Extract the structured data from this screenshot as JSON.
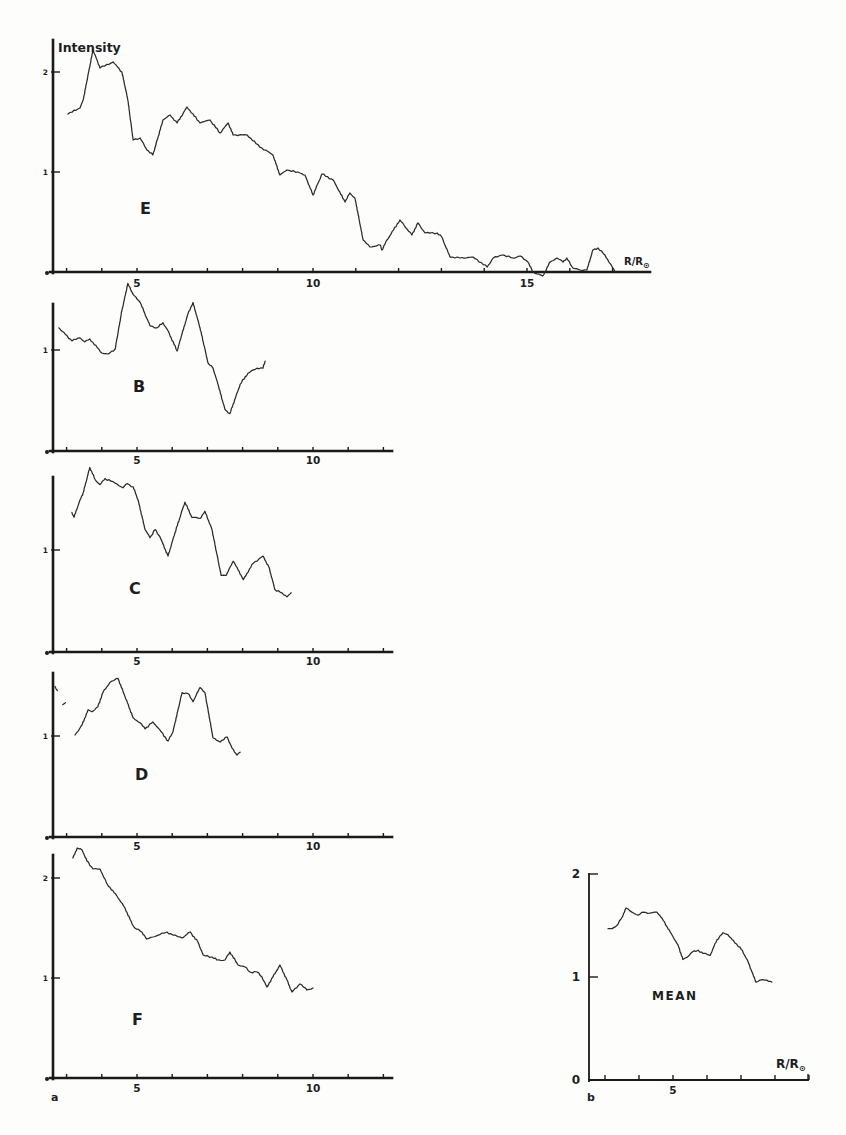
{
  "figure": {
    "ylabel": "Intensity",
    "panel_a_label": "a",
    "panel_b_label": "b"
  },
  "chart_data": [
    {
      "id": "E",
      "type": "line",
      "label": "E",
      "xlabel": "R/R⊙",
      "ylabel": "Intensity",
      "xlim": [
        2.61,
        17.87
      ],
      "ylim": [
        0,
        2.3
      ],
      "xticks": [
        3,
        4,
        5,
        6,
        7,
        8,
        9,
        10,
        11,
        12,
        13,
        14,
        15,
        16,
        17
      ],
      "xticklabels": [
        {
          "value": 5,
          "text": "5"
        },
        {
          "value": 10,
          "text": "10"
        },
        {
          "value": 15,
          "text": "15"
        }
      ],
      "yticks": [
        1,
        2
      ],
      "yticklabels": [
        {
          "value": 1,
          "text": "1"
        },
        {
          "value": 2,
          "text": "2"
        }
      ],
      "points": [
        [
          3.04,
          1.58
        ],
        [
          3.38,
          1.64
        ],
        [
          3.47,
          1.72
        ],
        [
          3.75,
          2.22
        ],
        [
          3.95,
          2.04
        ],
        [
          4.32,
          2.1
        ],
        [
          4.57,
          2.0
        ],
        [
          4.74,
          1.72
        ],
        [
          4.89,
          1.32
        ],
        [
          5.09,
          1.34
        ],
        [
          5.28,
          1.22
        ],
        [
          5.45,
          1.17
        ],
        [
          5.74,
          1.52
        ],
        [
          5.94,
          1.57
        ],
        [
          6.14,
          1.49
        ],
        [
          6.42,
          1.65
        ],
        [
          6.79,
          1.49
        ],
        [
          7.07,
          1.52
        ],
        [
          7.36,
          1.39
        ],
        [
          7.59,
          1.49
        ],
        [
          7.73,
          1.37
        ],
        [
          8.13,
          1.37
        ],
        [
          8.49,
          1.25
        ],
        [
          8.78,
          1.19
        ],
        [
          8.86,
          1.17
        ],
        [
          9.06,
          0.97
        ],
        [
          9.26,
          1.02
        ],
        [
          9.63,
          0.99
        ],
        [
          9.77,
          0.97
        ],
        [
          10.0,
          0.77
        ],
        [
          10.21,
          0.98
        ],
        [
          10.47,
          0.92
        ],
        [
          10.75,
          0.7
        ],
        [
          10.86,
          0.79
        ],
        [
          10.98,
          0.74
        ],
        [
          11.17,
          0.32
        ],
        [
          11.33,
          0.25
        ],
        [
          11.57,
          0.27
        ],
        [
          11.61,
          0.22
        ],
        [
          11.73,
          0.32
        ],
        [
          12.03,
          0.52
        ],
        [
          12.31,
          0.37
        ],
        [
          12.45,
          0.49
        ],
        [
          12.62,
          0.39
        ],
        [
          12.9,
          0.39
        ],
        [
          13.01,
          0.35
        ],
        [
          13.2,
          0.15
        ],
        [
          13.43,
          0.14
        ],
        [
          13.74,
          0.15
        ],
        [
          14.07,
          0.05
        ],
        [
          14.21,
          0.14
        ],
        [
          14.42,
          0.17
        ],
        [
          14.67,
          0.14
        ],
        [
          14.84,
          0.16
        ],
        [
          15.02,
          0.1
        ],
        [
          15.14,
          0.0
        ],
        [
          15.37,
          -0.04
        ],
        [
          15.54,
          0.1
        ],
        [
          15.7,
          0.14
        ],
        [
          15.84,
          0.1
        ],
        [
          15.93,
          0.14
        ],
        [
          16.07,
          0.04
        ],
        [
          16.24,
          0.02
        ],
        [
          16.4,
          0.02
        ],
        [
          16.54,
          0.22
        ],
        [
          16.66,
          0.24
        ],
        [
          16.82,
          0.17
        ],
        [
          17.06,
          0.0
        ]
      ],
      "fragments": []
    },
    {
      "id": "B",
      "type": "line",
      "label": "B",
      "xlabel": "",
      "ylabel": "",
      "xlim": [
        2.61,
        12.24
      ],
      "ylim": [
        0,
        1.45
      ],
      "xticks": [
        3,
        4,
        5,
        6,
        7,
        8,
        9,
        10,
        11,
        12
      ],
      "xticklabels": [
        {
          "value": 5,
          "text": "5"
        },
        {
          "value": 10,
          "text": "10"
        }
      ],
      "yticks": [
        1
      ],
      "yticklabels": [
        {
          "value": 1,
          "text": "1"
        }
      ],
      "points": [
        [
          2.78,
          1.22
        ],
        [
          3.15,
          1.09
        ],
        [
          3.38,
          1.12
        ],
        [
          3.52,
          1.08
        ],
        [
          3.66,
          1.11
        ],
        [
          4.0,
          0.97
        ],
        [
          4.18,
          0.96
        ],
        [
          4.38,
          1.01
        ],
        [
          4.57,
          1.39
        ],
        [
          4.74,
          1.66
        ],
        [
          4.89,
          1.55
        ],
        [
          5.09,
          1.47
        ],
        [
          5.37,
          1.24
        ],
        [
          5.57,
          1.22
        ],
        [
          5.74,
          1.27
        ],
        [
          5.88,
          1.19
        ],
        [
          6.14,
          0.99
        ],
        [
          6.28,
          1.16
        ],
        [
          6.45,
          1.36
        ],
        [
          6.59,
          1.47
        ],
        [
          6.79,
          1.22
        ],
        [
          7.02,
          0.87
        ],
        [
          7.16,
          0.82
        ],
        [
          7.3,
          0.66
        ],
        [
          7.5,
          0.41
        ],
        [
          7.64,
          0.37
        ],
        [
          7.93,
          0.66
        ],
        [
          8.15,
          0.77
        ],
        [
          8.41,
          0.82
        ],
        [
          8.58,
          0.82
        ],
        [
          8.64,
          0.89
        ]
      ],
      "fragments": []
    },
    {
      "id": "C",
      "type": "line",
      "label": "C",
      "xlabel": "",
      "ylabel": "",
      "xlim": [
        2.61,
        12.24
      ],
      "ylim": [
        0,
        1.72
      ],
      "xticks": [
        3,
        4,
        5,
        6,
        7,
        8,
        9,
        10,
        11,
        12
      ],
      "xticklabels": [
        {
          "value": 5,
          "text": "5"
        },
        {
          "value": 10,
          "text": "10"
        }
      ],
      "yticks": [
        1
      ],
      "yticklabels": [
        {
          "value": 1,
          "text": "1"
        }
      ],
      "points": [
        [
          3.15,
          1.37
        ],
        [
          3.21,
          1.32
        ],
        [
          3.38,
          1.49
        ],
        [
          3.47,
          1.56
        ],
        [
          3.66,
          1.81
        ],
        [
          3.81,
          1.69
        ],
        [
          3.95,
          1.64
        ],
        [
          4.09,
          1.7
        ],
        [
          4.32,
          1.67
        ],
        [
          4.6,
          1.61
        ],
        [
          4.72,
          1.65
        ],
        [
          4.89,
          1.62
        ],
        [
          5.03,
          1.49
        ],
        [
          5.23,
          1.2
        ],
        [
          5.37,
          1.12
        ],
        [
          5.51,
          1.2
        ],
        [
          5.65,
          1.13
        ],
        [
          5.88,
          0.94
        ],
        [
          6.08,
          1.17
        ],
        [
          6.36,
          1.47
        ],
        [
          6.56,
          1.32
        ],
        [
          6.79,
          1.31
        ],
        [
          6.93,
          1.38
        ],
        [
          7.13,
          1.2
        ],
        [
          7.39,
          0.75
        ],
        [
          7.53,
          0.75
        ],
        [
          7.73,
          0.89
        ],
        [
          7.84,
          0.83
        ],
        [
          8.02,
          0.71
        ],
        [
          8.3,
          0.87
        ],
        [
          8.58,
          0.94
        ],
        [
          8.75,
          0.83
        ],
        [
          8.92,
          0.61
        ],
        [
          9.12,
          0.58
        ],
        [
          9.26,
          0.54
        ],
        [
          9.38,
          0.58
        ]
      ],
      "fragments": []
    },
    {
      "id": "D",
      "type": "line",
      "label": "D",
      "xlabel": "",
      "ylabel": "",
      "xlim": [
        2.61,
        12.24
      ],
      "ylim": [
        0,
        1.62
      ],
      "xticks": [
        3,
        4,
        5,
        6,
        7,
        8,
        9,
        10,
        11,
        12
      ],
      "xticklabels": [
        {
          "value": 5,
          "text": "5"
        },
        {
          "value": 10,
          "text": "10"
        }
      ],
      "yticks": [
        1
      ],
      "yticklabels": [
        {
          "value": 1,
          "text": "1"
        }
      ],
      "points": [
        [
          3.24,
          1.01
        ],
        [
          3.44,
          1.11
        ],
        [
          3.61,
          1.26
        ],
        [
          3.72,
          1.24
        ],
        [
          3.89,
          1.29
        ],
        [
          4.03,
          1.43
        ],
        [
          4.23,
          1.53
        ],
        [
          4.46,
          1.57
        ],
        [
          4.66,
          1.39
        ],
        [
          4.89,
          1.18
        ],
        [
          5.09,
          1.13
        ],
        [
          5.23,
          1.07
        ],
        [
          5.45,
          1.14
        ],
        [
          5.65,
          1.06
        ],
        [
          5.88,
          0.95
        ],
        [
          6.02,
          1.04
        ],
        [
          6.28,
          1.43
        ],
        [
          6.45,
          1.42
        ],
        [
          6.59,
          1.34
        ],
        [
          6.79,
          1.48
        ],
        [
          6.93,
          1.43
        ],
        [
          7.16,
          0.98
        ],
        [
          7.36,
          0.94
        ],
        [
          7.56,
          0.99
        ],
        [
          7.7,
          0.88
        ],
        [
          7.84,
          0.81
        ],
        [
          7.93,
          0.84
        ]
      ],
      "fragments": [
        [
          [
            2.67,
            1.49
          ],
          [
            2.74,
            1.45
          ]
        ],
        [
          [
            2.89,
            1.31
          ],
          [
            2.97,
            1.33
          ]
        ]
      ]
    },
    {
      "id": "F",
      "type": "line",
      "label": "F",
      "xlabel": "",
      "ylabel": "",
      "xlim": [
        2.61,
        12.24
      ],
      "ylim": [
        0,
        2.23
      ],
      "xticks": [
        3,
        4,
        5,
        6,
        7,
        8,
        9,
        10,
        11,
        12
      ],
      "xticklabels": [
        {
          "value": 5,
          "text": "5"
        },
        {
          "value": 10,
          "text": "10"
        }
      ],
      "yticks": [
        1,
        2
      ],
      "yticklabels": [
        {
          "value": 1,
          "text": "1"
        },
        {
          "value": 2,
          "text": "2"
        }
      ],
      "points": [
        [
          3.18,
          2.2
        ],
        [
          3.3,
          2.3
        ],
        [
          3.44,
          2.28
        ],
        [
          3.58,
          2.17
        ],
        [
          3.75,
          2.09
        ],
        [
          3.95,
          2.09
        ],
        [
          4.15,
          1.94
        ],
        [
          4.43,
          1.82
        ],
        [
          4.66,
          1.7
        ],
        [
          4.86,
          1.54
        ],
        [
          4.94,
          1.5
        ],
        [
          5.14,
          1.46
        ],
        [
          5.28,
          1.39
        ],
        [
          5.45,
          1.41
        ],
        [
          5.85,
          1.46
        ],
        [
          6.02,
          1.43
        ],
        [
          6.28,
          1.4
        ],
        [
          6.51,
          1.46
        ],
        [
          6.73,
          1.36
        ],
        [
          6.88,
          1.23
        ],
        [
          7.13,
          1.21
        ],
        [
          7.27,
          1.18
        ],
        [
          7.5,
          1.18
        ],
        [
          7.64,
          1.26
        ],
        [
          7.87,
          1.13
        ],
        [
          8.07,
          1.11
        ],
        [
          8.21,
          1.06
        ],
        [
          8.41,
          1.06
        ],
        [
          8.55,
          1.01
        ],
        [
          8.69,
          0.91
        ],
        [
          8.86,
          1.01
        ],
        [
          9.06,
          1.13
        ],
        [
          9.26,
          0.98
        ],
        [
          9.4,
          0.86
        ],
        [
          9.63,
          0.94
        ],
        [
          9.83,
          0.88
        ],
        [
          10.0,
          0.9
        ]
      ],
      "fragments": []
    },
    {
      "id": "MEAN",
      "type": "line",
      "label": "MEAN",
      "xlabel": "R/R⊙",
      "ylabel": "",
      "xlim": [
        2.53,
        9.0
      ],
      "ylim": [
        0,
        2
      ],
      "xticks": [
        3,
        4,
        5,
        6,
        7,
        8,
        9
      ],
      "xticklabels": [
        {
          "value": 5,
          "text": "5"
        }
      ],
      "yticks": [
        1,
        2
      ],
      "yticklabels": [
        {
          "value": 0,
          "text": "0"
        },
        {
          "value": 1,
          "text": "1"
        },
        {
          "value": 2,
          "text": "2"
        }
      ],
      "points": [
        [
          3.09,
          1.47
        ],
        [
          3.21,
          1.47
        ],
        [
          3.35,
          1.5
        ],
        [
          3.5,
          1.58
        ],
        [
          3.62,
          1.67
        ],
        [
          3.79,
          1.63
        ],
        [
          3.97,
          1.6
        ],
        [
          4.12,
          1.63
        ],
        [
          4.32,
          1.62
        ],
        [
          4.53,
          1.63
        ],
        [
          4.68,
          1.57
        ],
        [
          4.82,
          1.49
        ],
        [
          5.0,
          1.39
        ],
        [
          5.15,
          1.31
        ],
        [
          5.29,
          1.17
        ],
        [
          5.41,
          1.19
        ],
        [
          5.56,
          1.24
        ],
        [
          5.74,
          1.26
        ],
        [
          5.88,
          1.23
        ],
        [
          6.09,
          1.21
        ],
        [
          6.29,
          1.36
        ],
        [
          6.47,
          1.43
        ],
        [
          6.62,
          1.41
        ],
        [
          6.82,
          1.33
        ],
        [
          6.97,
          1.29
        ],
        [
          7.18,
          1.17
        ],
        [
          7.32,
          1.05
        ],
        [
          7.44,
          0.95
        ],
        [
          7.56,
          0.97
        ],
        [
          7.76,
          0.97
        ],
        [
          7.91,
          0.95
        ]
      ],
      "fragments": []
    }
  ]
}
